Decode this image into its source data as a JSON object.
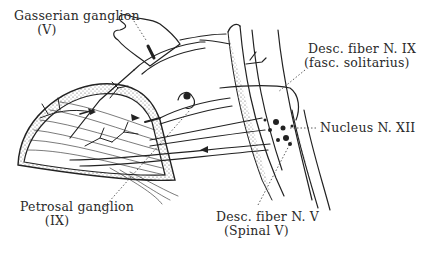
{
  "figure": {
    "type": "anatomical-nerve-pathway-diagram",
    "colors": {
      "ink": "#222222",
      "background": "#ffffff",
      "stipple": "#555555"
    },
    "labels": [
      {
        "id": "gasserian",
        "line1": "Gasserian ganglion",
        "line2": "(V)"
      },
      {
        "id": "desc_ix",
        "line1": "Desc. fiber N. IX",
        "line2": "(fasc. solitarius)"
      },
      {
        "id": "nucleus_xii",
        "line1": "Nucleus N. XII"
      },
      {
        "id": "petrosal",
        "line1": "Petrosal ganglion",
        "line2": "(IX)"
      },
      {
        "id": "desc_v",
        "line1": "Desc. fiber N. V",
        "line2": "(Spinal V)"
      }
    ]
  }
}
